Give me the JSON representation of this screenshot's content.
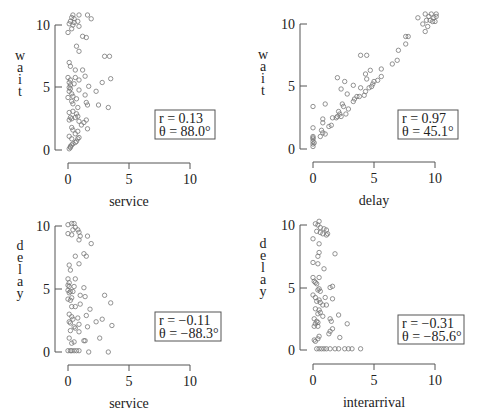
{
  "chart_data": [
    {
      "type": "scatter",
      "panel": "top-left",
      "xlabel": "service",
      "ylabel": "wait",
      "xlim": [
        0,
        10
      ],
      "ylim": [
        0,
        10
      ],
      "xticks": [
        "0",
        "5",
        "10"
      ],
      "yticks": [
        "0",
        "5",
        "10"
      ],
      "annotation": {
        "r": "r = 0.13",
        "theta": "θ = 88.0°"
      },
      "points": [
        [
          0.4,
          10.8
        ],
        [
          0.9,
          10.8
        ],
        [
          1.6,
          10.8
        ],
        [
          0.3,
          10.6
        ],
        [
          0.5,
          10.5
        ],
        [
          1.9,
          10.5
        ],
        [
          0.2,
          10.3
        ],
        [
          0.5,
          10.2
        ],
        [
          0.8,
          10.3
        ],
        [
          0.1,
          10.1
        ],
        [
          0.4,
          10.0
        ],
        [
          0.9,
          9.9
        ],
        [
          0.3,
          9.7
        ],
        [
          0.0,
          9.4
        ],
        [
          1.2,
          9.1
        ],
        [
          1.5,
          9.0
        ],
        [
          0.7,
          8.3
        ],
        [
          0.9,
          7.9
        ],
        [
          3.0,
          7.5
        ],
        [
          3.4,
          7.5
        ],
        [
          0.1,
          7.0
        ],
        [
          0.2,
          6.7
        ],
        [
          0.6,
          6.4
        ],
        [
          1.2,
          6.4
        ],
        [
          1.4,
          5.9
        ],
        [
          3.5,
          5.7
        ],
        [
          0.0,
          5.8
        ],
        [
          0.2,
          5.6
        ],
        [
          0.6,
          5.8
        ],
        [
          0.9,
          5.6
        ],
        [
          2.8,
          5.4
        ],
        [
          0.1,
          5.4
        ],
        [
          0.2,
          5.2
        ],
        [
          0.5,
          5.3
        ],
        [
          0.1,
          5.0
        ],
        [
          1.7,
          5.1
        ],
        [
          0.2,
          4.9
        ],
        [
          0.9,
          4.8
        ],
        [
          2.3,
          4.7
        ],
        [
          0.1,
          4.7
        ],
        [
          0.3,
          4.5
        ],
        [
          0.4,
          4.3
        ],
        [
          1.4,
          4.4
        ],
        [
          0.7,
          4.1
        ],
        [
          0.0,
          4.2
        ],
        [
          0.3,
          3.9
        ],
        [
          1.5,
          3.8
        ],
        [
          0.4,
          3.7
        ],
        [
          1.6,
          3.6
        ],
        [
          2.5,
          3.6
        ],
        [
          3.3,
          3.4
        ],
        [
          0.8,
          3.4
        ],
        [
          0.1,
          3.0
        ],
        [
          0.4,
          3.1
        ],
        [
          0.7,
          2.9
        ],
        [
          0.8,
          2.7
        ],
        [
          0.2,
          2.6
        ],
        [
          0.3,
          2.5
        ],
        [
          0.6,
          2.6
        ],
        [
          1.5,
          2.4
        ],
        [
          0.9,
          2.3
        ],
        [
          1.3,
          2.2
        ],
        [
          1.1,
          2.0
        ],
        [
          0.1,
          2.4
        ],
        [
          0.3,
          1.8
        ],
        [
          0.4,
          1.6
        ],
        [
          1.6,
          1.7
        ],
        [
          0.8,
          1.5
        ],
        [
          0.6,
          1.3
        ],
        [
          0.1,
          1.1
        ],
        [
          0.3,
          0.9
        ],
        [
          0.9,
          1.0
        ],
        [
          0.8,
          0.9
        ],
        [
          0.7,
          0.7
        ],
        [
          0.6,
          0.6
        ],
        [
          0.4,
          0.5
        ],
        [
          0.3,
          0.4
        ],
        [
          0.2,
          0.3
        ],
        [
          0.1,
          0.1
        ],
        [
          0.2,
          0.2
        ]
      ]
    },
    {
      "type": "scatter",
      "panel": "top-right",
      "xlabel": "delay",
      "ylabel": "wait",
      "xlim": [
        0,
        10
      ],
      "ylim": [
        0,
        10
      ],
      "xticks": [
        "0",
        "5",
        "10"
      ],
      "yticks": [
        "0",
        "5",
        "10"
      ],
      "annotation": {
        "r": "r = 0.97",
        "theta": "θ = 45.1°"
      },
      "points": [
        [
          9.2,
          10.8
        ],
        [
          9.7,
          10.8
        ],
        [
          10.1,
          10.8
        ],
        [
          9.5,
          10.6
        ],
        [
          9.9,
          10.5
        ],
        [
          10.1,
          10.6
        ],
        [
          8.6,
          10.5
        ],
        [
          9.3,
          10.3
        ],
        [
          9.6,
          10.3
        ],
        [
          9.8,
          10.2
        ],
        [
          10.0,
          10.2
        ],
        [
          9.0,
          10.0
        ],
        [
          9.4,
          9.8
        ],
        [
          9.2,
          9.4
        ],
        [
          7.6,
          9.0
        ],
        [
          7.8,
          9.0
        ],
        [
          7.6,
          8.4
        ],
        [
          7.0,
          7.9
        ],
        [
          6.9,
          7.1
        ],
        [
          6.5,
          6.8
        ],
        [
          3.9,
          7.5
        ],
        [
          4.4,
          7.5
        ],
        [
          4.7,
          6.3
        ],
        [
          5.6,
          6.4
        ],
        [
          4.3,
          6.0
        ],
        [
          5.6,
          5.8
        ],
        [
          2.0,
          5.7
        ],
        [
          2.6,
          5.4
        ],
        [
          4.4,
          5.6
        ],
        [
          5.0,
          5.4
        ],
        [
          5.3,
          5.5
        ],
        [
          4.9,
          5.2
        ],
        [
          4.8,
          5.0
        ],
        [
          4.6,
          4.9
        ],
        [
          3.3,
          5.1
        ],
        [
          3.9,
          4.9
        ],
        [
          2.3,
          4.8
        ],
        [
          4.3,
          4.6
        ],
        [
          3.6,
          4.2
        ],
        [
          3.8,
          4.2
        ],
        [
          3.4,
          4.0
        ],
        [
          4.2,
          4.3
        ],
        [
          2.8,
          4.4
        ],
        [
          3.3,
          3.8
        ],
        [
          2.4,
          3.6
        ],
        [
          1.0,
          3.6
        ],
        [
          0.0,
          3.4
        ],
        [
          2.5,
          3.4
        ],
        [
          2.9,
          3.2
        ],
        [
          2.1,
          3.0
        ],
        [
          2.2,
          2.8
        ],
        [
          2.7,
          2.8
        ],
        [
          2.3,
          2.6
        ],
        [
          2.0,
          2.6
        ],
        [
          1.9,
          2.5
        ],
        [
          1.6,
          2.5
        ],
        [
          0.8,
          2.4
        ],
        [
          0.8,
          2.1
        ],
        [
          1.3,
          1.8
        ],
        [
          1.5,
          1.9
        ],
        [
          0.0,
          1.7
        ],
        [
          0.7,
          1.5
        ],
        [
          0.8,
          1.3
        ],
        [
          1.0,
          1.2
        ],
        [
          0.6,
          1.0
        ],
        [
          0.0,
          1.0
        ],
        [
          0.0,
          0.9
        ],
        [
          0.0,
          0.8
        ],
        [
          0.0,
          0.6
        ],
        [
          0.1,
          0.5
        ],
        [
          0.0,
          0.4
        ],
        [
          0.0,
          0.2
        ]
      ]
    },
    {
      "type": "scatter",
      "panel": "bottom-left",
      "xlabel": "service",
      "ylabel": "delay",
      "xlim": [
        0,
        10
      ],
      "ylim": [
        0,
        10
      ],
      "xticks": [
        "0",
        "5",
        "10"
      ],
      "yticks": [
        "0",
        "5",
        "10"
      ],
      "annotation": {
        "r": "r = −0.11",
        "theta": "θ = −88.3°"
      },
      "points": [
        [
          0.3,
          10.2
        ],
        [
          0.5,
          10.2
        ],
        [
          0.0,
          10.1
        ],
        [
          0.6,
          9.9
        ],
        [
          0.8,
          9.7
        ],
        [
          0.4,
          9.7
        ],
        [
          0.9,
          9.5
        ],
        [
          0.0,
          9.4
        ],
        [
          0.3,
          9.3
        ],
        [
          1.0,
          9.2
        ],
        [
          1.6,
          9.2
        ],
        [
          0.9,
          8.9
        ],
        [
          1.9,
          8.6
        ],
        [
          1.3,
          7.8
        ],
        [
          1.5,
          7.6
        ],
        [
          0.6,
          7.6
        ],
        [
          0.9,
          7.0
        ],
        [
          0.1,
          6.9
        ],
        [
          0.2,
          6.5
        ],
        [
          0.0,
          5.8
        ],
        [
          0.6,
          5.8
        ],
        [
          0.1,
          5.5
        ],
        [
          0.0,
          5.3
        ],
        [
          0.1,
          5.2
        ],
        [
          0.5,
          5.2
        ],
        [
          1.3,
          5.1
        ],
        [
          0.0,
          4.9
        ],
        [
          0.2,
          4.8
        ],
        [
          0.1,
          4.7
        ],
        [
          0.4,
          4.8
        ],
        [
          1.0,
          4.5
        ],
        [
          1.4,
          4.4
        ],
        [
          3.0,
          4.5
        ],
        [
          0.3,
          4.3
        ],
        [
          0.0,
          4.2
        ],
        [
          0.2,
          4.1
        ],
        [
          3.5,
          3.9
        ],
        [
          1.0,
          3.8
        ],
        [
          0.6,
          3.6
        ],
        [
          0.3,
          3.6
        ],
        [
          1.8,
          3.4
        ],
        [
          0.1,
          3.0
        ],
        [
          1.5,
          2.9
        ],
        [
          0.3,
          2.8
        ],
        [
          0.8,
          2.7
        ],
        [
          0.4,
          2.6
        ],
        [
          2.8,
          2.6
        ],
        [
          2.3,
          2.4
        ],
        [
          0.1,
          2.4
        ],
        [
          0.2,
          2.3
        ],
        [
          0.9,
          2.2
        ],
        [
          3.6,
          2.1
        ],
        [
          0.5,
          2.0
        ],
        [
          1.6,
          2.0
        ],
        [
          0.6,
          1.9
        ],
        [
          0.2,
          1.7
        ],
        [
          0.9,
          1.6
        ],
        [
          0.1,
          1.1
        ],
        [
          2.6,
          1.1
        ],
        [
          1.3,
          0.9
        ],
        [
          1.4,
          0.9
        ],
        [
          0.5,
          0.8
        ],
        [
          0.3,
          0.7
        ],
        [
          0.0,
          0.1
        ],
        [
          0.2,
          0.1
        ],
        [
          0.3,
          0.1
        ],
        [
          0.5,
          0.1
        ],
        [
          0.7,
          0.1
        ],
        [
          0.9,
          0.1
        ],
        [
          1.7,
          0.0
        ],
        [
          3.3,
          0.0
        ]
      ]
    },
    {
      "type": "scatter",
      "panel": "bottom-right",
      "xlabel": "interarrival",
      "ylabel": "delay",
      "xlim": [
        0,
        10
      ],
      "ylim": [
        0,
        10
      ],
      "xticks": [
        "0",
        "5",
        "10"
      ],
      "yticks": [
        "0",
        "5",
        "10"
      ],
      "annotation": {
        "r": "r = −0.31",
        "theta": "θ = −85.6°"
      },
      "points": [
        [
          0.5,
          10.3
        ],
        [
          0.2,
          10.1
        ],
        [
          0.4,
          10.0
        ],
        [
          0.6,
          9.8
        ],
        [
          0.9,
          9.7
        ],
        [
          1.1,
          9.6
        ],
        [
          0.3,
          9.5
        ],
        [
          0.6,
          9.4
        ],
        [
          0.8,
          9.3
        ],
        [
          1.2,
          9.3
        ],
        [
          1.1,
          9.2
        ],
        [
          0.0,
          8.9
        ],
        [
          0.5,
          8.5
        ],
        [
          1.8,
          7.7
        ],
        [
          0.5,
          7.8
        ],
        [
          0.4,
          7.5
        ],
        [
          0.0,
          7.0
        ],
        [
          0.4,
          6.9
        ],
        [
          0.9,
          6.5
        ],
        [
          0.0,
          5.8
        ],
        [
          0.5,
          5.8
        ],
        [
          0.1,
          5.5
        ],
        [
          0.2,
          5.4
        ],
        [
          0.3,
          5.3
        ],
        [
          1.4,
          5.0
        ],
        [
          1.6,
          5.1
        ],
        [
          0.5,
          4.9
        ],
        [
          0.4,
          4.8
        ],
        [
          0.6,
          4.7
        ],
        [
          0.0,
          4.4
        ],
        [
          0.2,
          4.2
        ],
        [
          1.0,
          4.2
        ],
        [
          1.6,
          4.1
        ],
        [
          0.5,
          4.0
        ],
        [
          0.3,
          3.9
        ],
        [
          0.6,
          3.8
        ],
        [
          1.1,
          3.6
        ],
        [
          0.8,
          3.6
        ],
        [
          0.2,
          3.3
        ],
        [
          0.5,
          3.2
        ],
        [
          0.6,
          3.0
        ],
        [
          0.4,
          2.9
        ],
        [
          0.8,
          2.7
        ],
        [
          2.1,
          2.8
        ],
        [
          0.1,
          2.5
        ],
        [
          1.4,
          2.5
        ],
        [
          0.3,
          2.3
        ],
        [
          0.4,
          2.2
        ],
        [
          1.5,
          2.3
        ],
        [
          0.2,
          2.1
        ],
        [
          2.8,
          2.1
        ],
        [
          0.1,
          1.9
        ],
        [
          0.4,
          1.9
        ],
        [
          1.6,
          1.7
        ],
        [
          1.4,
          1.5
        ],
        [
          1.3,
          1.3
        ],
        [
          0.5,
          1.1
        ],
        [
          2.2,
          1.0
        ],
        [
          0.4,
          0.9
        ],
        [
          0.1,
          0.8
        ],
        [
          0.2,
          0.7
        ],
        [
          0.3,
          0.1
        ],
        [
          0.5,
          0.1
        ],
        [
          0.7,
          0.1
        ],
        [
          0.9,
          0.1
        ],
        [
          1.1,
          0.1
        ],
        [
          1.4,
          0.1
        ],
        [
          1.8,
          0.1
        ],
        [
          2.1,
          0.1
        ],
        [
          2.6,
          0.1
        ],
        [
          2.9,
          0.1
        ],
        [
          3.2,
          0.1
        ],
        [
          3.9,
          0.1
        ]
      ]
    }
  ],
  "panels": [
    {
      "xlabel": "service",
      "ylabel": "wait",
      "r": "r = 0.13",
      "theta": "θ = 88.0°"
    },
    {
      "xlabel": "delay",
      "ylabel": "wait",
      "r": "r = 0.97",
      "theta": "θ = 45.1°"
    },
    {
      "xlabel": "service",
      "ylabel": "delay",
      "r": "r = −0.11",
      "theta": "θ = −88.3°"
    },
    {
      "xlabel": "interarrival",
      "ylabel": "delay",
      "r": "r = −0.31",
      "theta": "θ = −85.6°"
    }
  ],
  "ticks": {
    "t0": "0",
    "t5": "5",
    "t10": "10"
  }
}
